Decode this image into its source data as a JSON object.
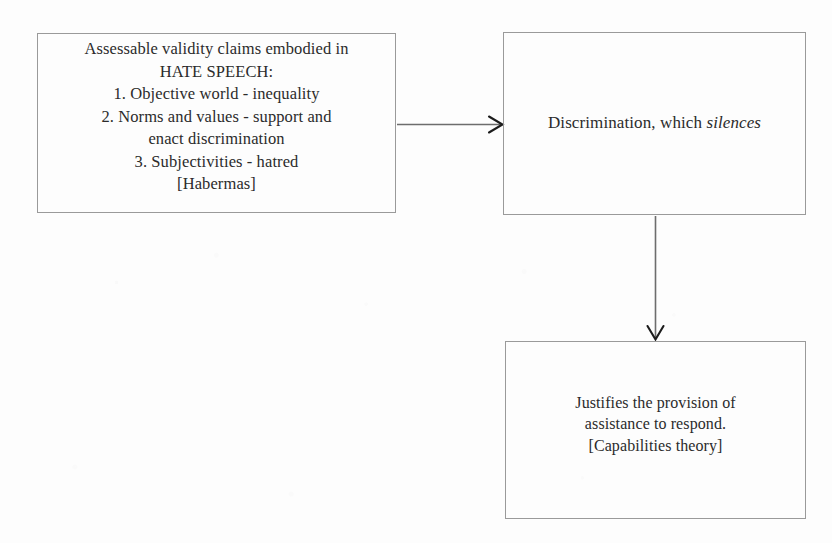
{
  "diagram": {
    "type": "flow-diagram",
    "background_color": "#fdfdfd",
    "text_color": "#2b2b2b",
    "border_color": "#9a9a9a",
    "arrow_color": "#6d6d6d",
    "nodes": [
      {
        "id": "validity-claims",
        "text": "Assessable validity claims embodied in\nHATE SPEECH:\n1. Objective world - inequality\n2. Norms and values - support and\nenact discrimination\n3. Subjectivities - hatred\n[Habermas]",
        "lines": [
          "Assessable validity claims embodied in",
          "HATE SPEECH:",
          "1. Objective world - inequality",
          "2. Norms and values - support and",
          "enact discrimination",
          "3. Subjectivities - hatred",
          "[Habermas]"
        ],
        "citation": "[Habermas]"
      },
      {
        "id": "discrimination",
        "text_before_italic": "Discrimination, which ",
        "italic_word": "silences",
        "text_after_italic": ""
      },
      {
        "id": "justifies",
        "text": "Justifies the provision of\nassistance to respond.\n[Capabilities theory]",
        "lines": [
          "Justifies the provision of",
          "assistance to respond.",
          "[Capabilities theory]"
        ],
        "citation": "[Capabilities theory]"
      }
    ],
    "edges": [
      {
        "id": "claims-to-discrimination",
        "from": "validity-claims",
        "to": "discrimination",
        "direction": "right",
        "label": ""
      },
      {
        "id": "discrimination-to-justifies",
        "from": "discrimination",
        "to": "justifies",
        "direction": "down",
        "label": ""
      }
    ]
  }
}
